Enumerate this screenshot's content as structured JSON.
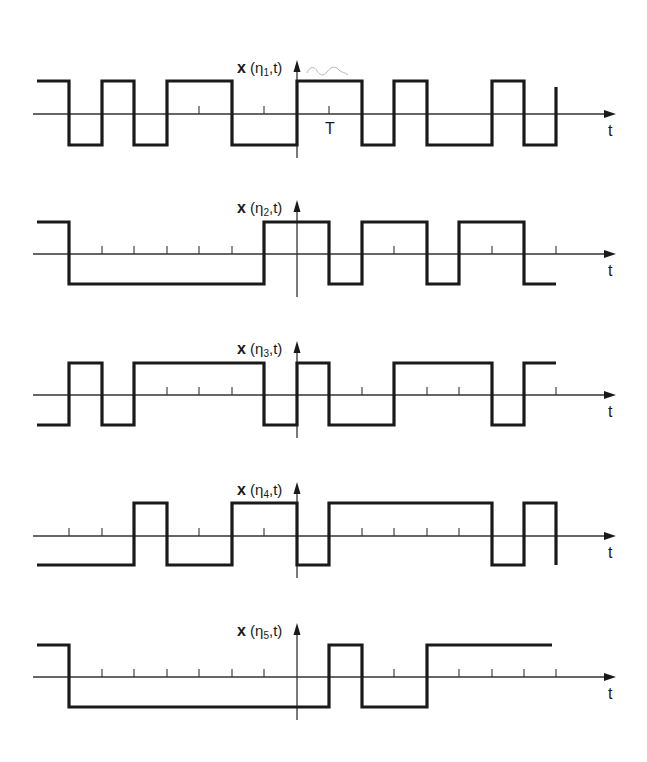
{
  "figure": {
    "x_axis_label": "t",
    "tick_label_T": "T",
    "grid": {
      "x0": 37,
      "step": 32.45,
      "count": 17,
      "yaxis_x": 297
    },
    "colors": {
      "signal": "#1a1a1a",
      "axis": "#333333",
      "scribble": "#b8b8b8"
    }
  },
  "panels": [
    {
      "label_prefix": "x",
      "label_sub": "1",
      "label": "x(η1,t)",
      "axis_y": 114,
      "high_y": 81,
      "low_y": 145,
      "start_level": "high",
      "transitions_x": [
        69,
        102,
        134,
        167,
        232,
        297,
        362,
        394,
        427,
        492,
        524,
        556
      ],
      "end_x": 556,
      "end_to_level": "high_partial",
      "ticks_x": [
        199,
        232,
        264,
        329,
        427
      ],
      "t_tick_x": 329
    },
    {
      "label_prefix": "x",
      "label_sub": "2",
      "label": "x(η2,t)",
      "axis_y": 254,
      "high_y": 222,
      "low_y": 284,
      "start_level": "high",
      "transitions_x": [
        69,
        264,
        329,
        362,
        427,
        459,
        524
      ],
      "end_x": 556,
      "ticks_x": [
        102,
        134,
        167,
        199,
        232,
        394,
        492,
        556
      ]
    },
    {
      "label_prefix": "x",
      "label_sub": "3",
      "label": "x(η3,t)",
      "axis_y": 395,
      "high_y": 363,
      "low_y": 425,
      "start_level": "low",
      "transitions_x": [
        69,
        102,
        134,
        264,
        297,
        329,
        394,
        492,
        524
      ],
      "end_x": 556,
      "ticks_x": [
        167,
        199,
        232,
        362,
        427,
        459,
        556
      ]
    },
    {
      "label_prefix": "x",
      "label_sub": "4",
      "label": "x(η4,t)",
      "axis_y": 536,
      "high_y": 503,
      "low_y": 565,
      "start_level": "low",
      "transitions_x": [
        134,
        167,
        232,
        297,
        329,
        492,
        524,
        556
      ],
      "end_x": 556,
      "ticks_x": [
        69,
        102,
        199,
        264,
        362,
        394,
        427,
        459
      ]
    },
    {
      "label_prefix": "x",
      "label_sub": "5",
      "label": "x(η5,t)",
      "axis_y": 677,
      "high_y": 645,
      "low_y": 707,
      "start_level": "high",
      "transitions_x": [
        69,
        329,
        362,
        427
      ],
      "end_x": 552,
      "ticks_x": [
        102,
        134,
        167,
        199,
        232,
        264,
        394,
        459,
        492,
        524,
        556
      ]
    }
  ]
}
